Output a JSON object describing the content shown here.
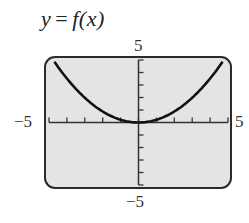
{
  "title": {
    "lhs": "y",
    "eq": "=",
    "rhs": "f(x)"
  },
  "labels": {
    "y_max": "5",
    "y_min": "−5",
    "x_min": "−5",
    "x_max": "5"
  },
  "colors": {
    "plot_bg": "#e4e4e4",
    "frame": "#2a2a2a",
    "curve": "#111111",
    "axis": "#333333"
  },
  "chart_data": {
    "type": "line",
    "xlabel": "",
    "ylabel": "",
    "xlim": [
      -5,
      5
    ],
    "ylim": [
      -5,
      5
    ],
    "x_ticks": [
      -5,
      -4,
      -3,
      -2,
      -1,
      0,
      1,
      2,
      3,
      4,
      5
    ],
    "y_ticks": [
      -5,
      -4,
      -3,
      -2,
      -1,
      0,
      1,
      2,
      3,
      4,
      5
    ],
    "grid": false,
    "series": [
      {
        "name": "f(x)",
        "x": [
          -4.7,
          -4,
          -3,
          -2,
          -1,
          0,
          1,
          2,
          3,
          4,
          4.7
        ],
        "y": [
          4.86,
          3.52,
          1.98,
          0.88,
          0.22,
          0,
          0.22,
          0.88,
          1.98,
          3.52,
          4.86
        ]
      }
    ]
  }
}
